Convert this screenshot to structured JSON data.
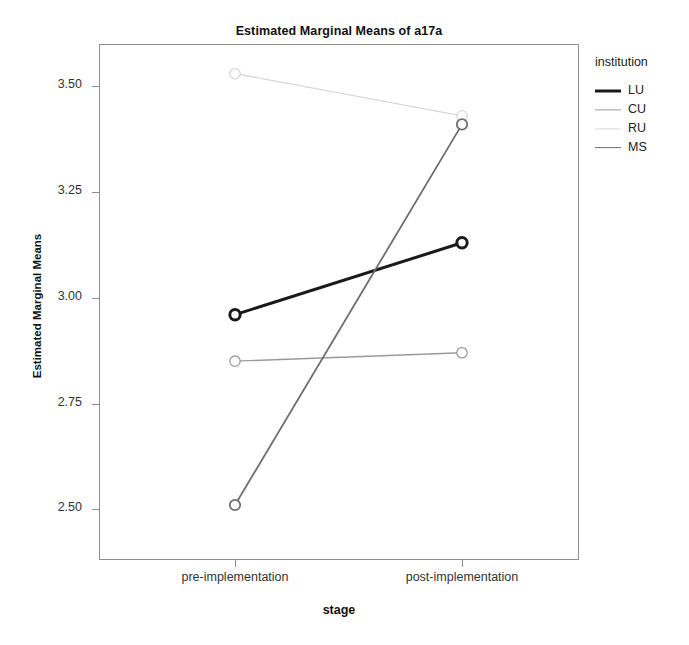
{
  "page": {
    "header_remnant": "",
    "title": "Estimated Marginal Means of a17a"
  },
  "axes": {
    "y_title": "Estimated Marginal Means",
    "x_title": "stage",
    "y_ticks": [
      "2.50",
      "2.75",
      "3.00",
      "3.25",
      "3.50"
    ],
    "x_ticks": [
      "pre-implementation",
      "post-implementation"
    ]
  },
  "legend": {
    "title": "institution",
    "entries": [
      {
        "label": "LU",
        "color": "#1a1a1a",
        "width": 3.0
      },
      {
        "label": "CU",
        "color": "#9a9a9a",
        "width": 1.3
      },
      {
        "label": "RU",
        "color": "#d8d8d8",
        "width": 1.3
      },
      {
        "label": "MS",
        "color": "#6e6e6e",
        "width": 1.8
      }
    ]
  },
  "chart_data": {
    "type": "line",
    "title": "Estimated Marginal Means of a17a",
    "xlabel": "stage",
    "ylabel": "Estimated Marginal Means",
    "legend_title": "institution",
    "legend_position": "right",
    "grid": false,
    "categories": [
      "pre-implementation",
      "post-implementation"
    ],
    "ylim": [
      2.38,
      3.6
    ],
    "yticks": [
      2.5,
      2.75,
      3.0,
      3.25,
      3.5
    ],
    "marker": "open-circle",
    "series": [
      {
        "name": "LU",
        "values": [
          2.96,
          3.13
        ],
        "color": "#1a1a1a",
        "width": 3.0
      },
      {
        "name": "CU",
        "values": [
          2.85,
          2.87
        ],
        "color": "#9a9a9a",
        "width": 1.3
      },
      {
        "name": "RU",
        "values": [
          3.53,
          3.43
        ],
        "color": "#d8d8d8",
        "width": 1.3
      },
      {
        "name": "MS",
        "values": [
          2.51,
          3.41
        ],
        "color": "#6e6e6e",
        "width": 1.8
      }
    ]
  }
}
